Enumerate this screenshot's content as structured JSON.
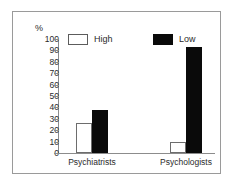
{
  "chart_data": {
    "type": "bar",
    "title": "",
    "subtitle": "",
    "xlabel": "",
    "ylabel": "%",
    "ylim": [
      0,
      100
    ],
    "ytick_step": 10,
    "yticks": [
      "100",
      "90",
      "80",
      "70",
      "60",
      "50",
      "40",
      "30",
      "20",
      "10",
      "0"
    ],
    "grid": false,
    "legend_position": "top-inside",
    "categories": [
      "Psychiatrists",
      "Psychologists"
    ],
    "series": [
      {
        "name": "High",
        "values": [
          26,
          10
        ],
        "color": "#ffffff",
        "edge_color": "#6d6d6d"
      },
      {
        "name": "Low",
        "values": [
          38,
          93
        ],
        "color": "#0a0a0a",
        "edge_color": "#0a0a0a"
      }
    ]
  },
  "axis": {
    "y_unit_label": "%"
  },
  "legend": {
    "items": [
      {
        "label": "High",
        "swatch": "white-outlined-square"
      },
      {
        "label": "Low",
        "swatch": "black-filled-square"
      }
    ]
  },
  "frame": {
    "border_color": "#9a9a9a",
    "background": "#ffffff"
  }
}
